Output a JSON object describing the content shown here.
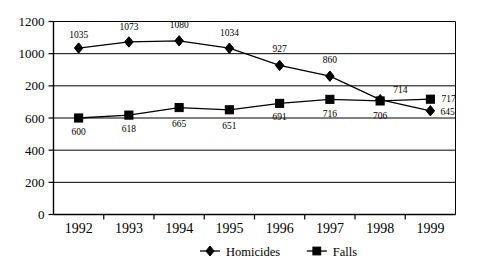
{
  "chart_data": {
    "type": "line",
    "title": "",
    "xlabel": "",
    "ylabel": "",
    "x": [
      "1992",
      "1993",
      "1994",
      "1995",
      "1996",
      "1997",
      "1998",
      "1999"
    ],
    "categories": [
      "1992",
      "1993",
      "1994",
      "1995",
      "1996",
      "1997",
      "1998",
      "1999"
    ],
    "ylim": [
      0,
      1200
    ],
    "ytick_values": [
      0,
      200,
      400,
      600,
      800,
      1000,
      1200
    ],
    "ytick_labels": [
      "0",
      "200",
      "400",
      "600",
      "200",
      "1000",
      "1200"
    ],
    "grid": true,
    "legend_position": "bottom",
    "series": [
      {
        "name": "Homicides",
        "marker": "diamond",
        "values": [
          1035,
          1073,
          1080,
          1034,
          927,
          860,
          714,
          645
        ],
        "labels": [
          "1035",
          "1073",
          "1080",
          "1034",
          "927",
          "860",
          "714",
          "645"
        ]
      },
      {
        "name": "Falls",
        "marker": "square",
        "values": [
          600,
          618,
          665,
          651,
          691,
          716,
          706,
          717
        ],
        "labels": [
          "600",
          "618",
          "665",
          "651",
          "691",
          "716",
          "706",
          "717"
        ]
      }
    ]
  },
  "legend": {
    "items": [
      {
        "label": "Homicides",
        "marker": "diamond"
      },
      {
        "label": "Falls",
        "marker": "square"
      }
    ]
  },
  "colors": {
    "ink": "#000000",
    "background": "#ffffff"
  }
}
